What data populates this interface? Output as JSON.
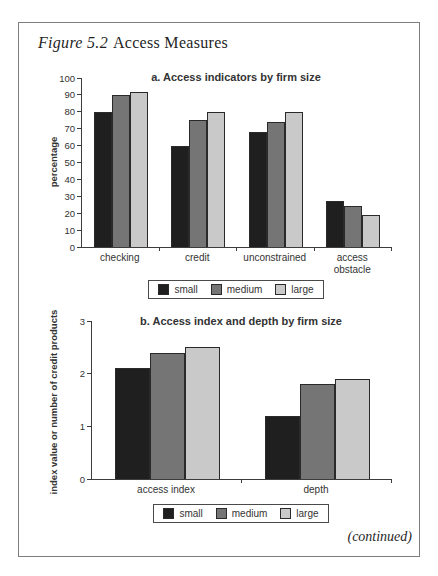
{
  "figure": {
    "label": "Figure 5.2",
    "title": "Access Measures",
    "continued": "(continued)"
  },
  "colors": {
    "series": {
      "small": "#1f1f1f",
      "medium": "#757575",
      "large": "#c9c9c9"
    },
    "bar_border": "#2a2a2a",
    "axis": "#3c3c3c",
    "text": "#333333",
    "frame_border": "#7e7e7e",
    "background": "#ffffff"
  },
  "chart_data": [
    {
      "type": "bar",
      "panel": "a",
      "title": "a. Access indicators by firm size",
      "ylabel": "percentage",
      "ylim": [
        0,
        100
      ],
      "yticks": [
        0,
        10,
        20,
        30,
        40,
        50,
        60,
        70,
        80,
        90,
        100
      ],
      "grid": false,
      "legend_position": "bottom",
      "categories": [
        "checking",
        "credit",
        "unconstrained",
        "access\nobstacle"
      ],
      "series": [
        {
          "name": "small",
          "values": [
            80,
            60,
            68,
            27
          ]
        },
        {
          "name": "medium",
          "values": [
            90,
            75,
            74,
            24
          ]
        },
        {
          "name": "large",
          "values": [
            92,
            80,
            80,
            19
          ]
        }
      ]
    },
    {
      "type": "bar",
      "panel": "b",
      "title": "b. Access index and depth by firm size",
      "ylabel": "index value or number of credit products",
      "ylim": [
        0,
        3
      ],
      "yticks": [
        0,
        1,
        2,
        3
      ],
      "grid": false,
      "legend_position": "bottom",
      "categories": [
        "access index",
        "depth"
      ],
      "series": [
        {
          "name": "small",
          "values": [
            2.1,
            1.2
          ]
        },
        {
          "name": "medium",
          "values": [
            2.4,
            1.8
          ]
        },
        {
          "name": "large",
          "values": [
            2.5,
            1.9
          ]
        }
      ]
    }
  ]
}
